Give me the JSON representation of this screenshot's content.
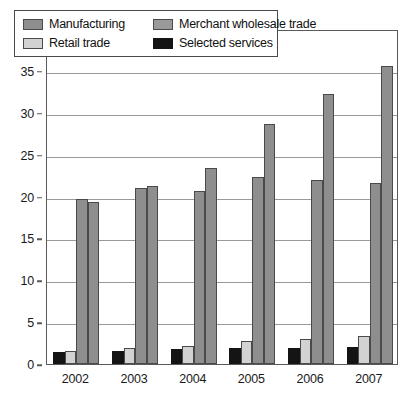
{
  "chart_data": {
    "type": "bar",
    "title": "",
    "subtitle": "",
    "xlabel": "",
    "ylabel": "",
    "categories": [
      "2002",
      "2003",
      "2004",
      "2005",
      "2006",
      "2007"
    ],
    "ylim": [
      0,
      40
    ],
    "ytick_step": 5,
    "ytick_labels": [
      "0",
      "5",
      "10",
      "15",
      "20",
      "25",
      "30",
      "35",
      "40"
    ],
    "grid": true,
    "grid_axis": "y",
    "legend_position": "top-left-inside",
    "legend_columns": 2,
    "bar_order": [
      "Selected services",
      "Retail trade",
      "Manufacturing",
      "Merchant wholesale trade"
    ],
    "series": [
      {
        "name": "Selected services",
        "color": "#141414",
        "values": [
          1.4,
          1.6,
          1.8,
          1.9,
          1.9,
          2.0
        ]
      },
      {
        "name": "Retail trade",
        "color": "#d2d2d2",
        "values": [
          1.6,
          1.9,
          2.2,
          2.7,
          3.0,
          3.3
        ]
      },
      {
        "name": "Manufacturing",
        "color": "#8e8e8e",
        "values": [
          19.7,
          21.0,
          20.6,
          22.3,
          22.0,
          21.6
        ]
      },
      {
        "name": "Merchant wholesale trade",
        "color": "#8e8e8e",
        "values": [
          19.4,
          21.2,
          23.4,
          28.6,
          32.2,
          35.6
        ]
      }
    ]
  },
  "legend": {
    "entries": [
      {
        "label": "Manufacturing",
        "swatch": "s-manufacturing"
      },
      {
        "label": "Merchant wholesale trade",
        "swatch": "s-merchant"
      },
      {
        "label": "Retail trade",
        "swatch": "s-retail"
      },
      {
        "label": "Selected services",
        "swatch": "s-services"
      }
    ]
  },
  "colors": {
    "frame": "#5a5a5a",
    "gridline": "#9a9a9a",
    "text": "#1a1a1a",
    "background": "#ffffff"
  }
}
